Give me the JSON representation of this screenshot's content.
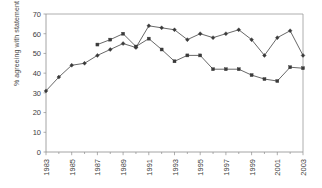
{
  "chart_data": {
    "type": "line",
    "title": "",
    "xlabel": "",
    "ylabel": "% agreeing with statement",
    "ylim": [
      0,
      70
    ],
    "ytick_labels": [
      "0",
      "10",
      "20",
      "30",
      "40",
      "50",
      "60",
      "70"
    ],
    "ytick_values": [
      0,
      10,
      20,
      30,
      40,
      50,
      60,
      70
    ],
    "xlim": [
      1983,
      2003
    ],
    "xtick_labels": [
      "1983",
      "1985",
      "1987",
      "1989",
      "1991",
      "1993",
      "1995",
      "1997",
      "1999",
      "2001",
      "2003"
    ],
    "xtick_values": [
      1983,
      1985,
      1987,
      1989,
      1991,
      1993,
      1995,
      1997,
      1999,
      2001,
      2003
    ],
    "grid": false,
    "legend": "none",
    "series": [
      {
        "name": "Series 1",
        "marker": "diamond",
        "color": "#3a3a3a",
        "x": [
          1983,
          1984,
          1985,
          1986,
          1987,
          1988,
          1989,
          1990,
          1991,
          1992,
          1993,
          1994,
          1995,
          1996,
          1997,
          1998,
          1999,
          2000,
          2001,
          2002,
          2003
        ],
        "values": [
          31,
          38,
          44,
          45,
          49,
          52,
          55,
          53,
          64,
          63,
          62,
          57,
          60,
          58,
          60,
          62,
          57,
          49,
          58,
          61.5,
          49
        ]
      },
      {
        "name": "Series 2",
        "marker": "square",
        "color": "#3a3a3a",
        "x": [
          1987,
          1988,
          1989,
          1990,
          1991,
          1992,
          1993,
          1994,
          1995,
          1996,
          1997,
          1998,
          1999,
          2000,
          2001,
          2002,
          2003
        ],
        "values": [
          54.5,
          57,
          60,
          53.5,
          57.5,
          52,
          46,
          49,
          49,
          42,
          42,
          42,
          39,
          37,
          36,
          43,
          42.5
        ]
      }
    ]
  }
}
